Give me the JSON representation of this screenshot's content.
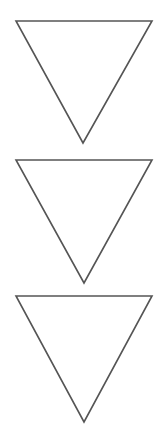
{
  "figure": {
    "background_color": "#ffffff",
    "width": 165,
    "height": 443,
    "stroke_color": "#555555",
    "stroke_width": 1.6,
    "fill": "none",
    "shape_count": 3,
    "shape_kind": "inverted-triangle-outline",
    "shapes": [
      {
        "name": "triangle-1",
        "orientation": "point-down",
        "points": "16,21 152,21 83,143",
        "vertices": {
          "top_left": [
            16,
            21
          ],
          "top_right": [
            152,
            21
          ],
          "bottom_apex": [
            83,
            143
          ]
        },
        "width": 136,
        "height": 122
      },
      {
        "name": "triangle-2",
        "orientation": "point-down",
        "points": "16,160 152,160 84,283",
        "vertices": {
          "top_left": [
            16,
            160
          ],
          "top_right": [
            152,
            160
          ],
          "bottom_apex": [
            84,
            283
          ]
        },
        "width": 136,
        "height": 123
      },
      {
        "name": "triangle-3",
        "orientation": "point-down",
        "points": "16,296 152,296 84,422",
        "vertices": {
          "top_left": [
            16,
            296
          ],
          "top_right": [
            152,
            296
          ],
          "bottom_apex": [
            84,
            422
          ]
        },
        "width": 136,
        "height": 126
      }
    ]
  }
}
